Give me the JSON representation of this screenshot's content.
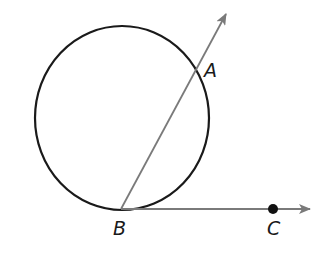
{
  "diagram": {
    "colors": {
      "circle": "#1a1a1a",
      "rays": "#7a7a7a",
      "point": "#111111",
      "label": "#1a1a1a"
    },
    "circle": {
      "cx": 122,
      "cy": 118,
      "rx": 87,
      "ry": 92
    },
    "points": {
      "A": {
        "label": "A",
        "x": 197,
        "y": 74,
        "label_x": 204,
        "label_y": 77
      },
      "B": {
        "label": "B",
        "x": 121,
        "y": 209,
        "label_x": 113,
        "label_y": 235
      },
      "C": {
        "label": "C",
        "x": 273,
        "y": 209,
        "label_x": 267,
        "label_y": 235
      }
    },
    "rays": [
      {
        "name": "ray-BA",
        "from": "B",
        "through": "A",
        "tip_x": 226,
        "tip_y": 14
      },
      {
        "name": "ray-BC",
        "from": "B",
        "through": "C",
        "tip_x": 310,
        "tip_y": 209
      }
    ]
  }
}
